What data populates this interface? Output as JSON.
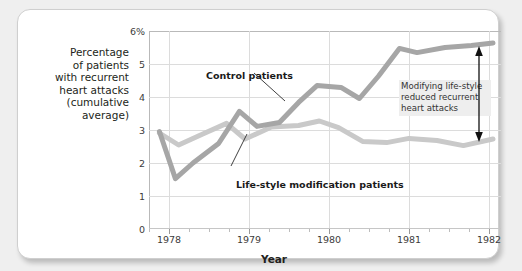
{
  "chart_data": {
    "type": "line",
    "title": "",
    "xlabel": "Year",
    "ylabel": "Percentage\nof patients\nwith recurrent\nheart attacks\n(cumulative\naverage)",
    "xlim": [
      1977.75,
      1982.15
    ],
    "ylim": [
      0,
      6.6
    ],
    "grid": true,
    "legend_position": "inline-annotations",
    "x_ticks": [
      "1978",
      "1979",
      "1980",
      "1981",
      "1982"
    ],
    "x_tick_values": [
      1978,
      1979,
      1980,
      1981,
      1982
    ],
    "x_minor_ticks_per_interval": 4,
    "y_ticks": [
      "0",
      "1",
      "2",
      "3",
      "4",
      "5",
      "6%"
    ],
    "y_tick_values": [
      0,
      1,
      2,
      3,
      4,
      5,
      6
    ],
    "series": [
      {
        "name": "Control patients",
        "color": "#a6a6a6",
        "x": [
          1977.88,
          1978.08,
          1978.3,
          1978.62,
          1978.88,
          1979.1,
          1979.38,
          1979.62,
          1979.85,
          1980.15,
          1980.38,
          1980.62,
          1980.88,
          1981.1,
          1981.45,
          1981.78,
          1982.05
        ],
        "values": [
          3.25,
          1.68,
          2.2,
          2.85,
          3.92,
          3.42,
          3.55,
          4.22,
          4.78,
          4.72,
          4.35,
          5.1,
          6.02,
          5.88,
          6.05,
          6.12,
          6.2
        ]
      },
      {
        "name": "Life-style modification patients",
        "color": "#c9c9c9",
        "x": [
          1977.88,
          1978.12,
          1978.45,
          1978.72,
          1978.95,
          1979.28,
          1979.62,
          1979.88,
          1980.12,
          1980.42,
          1980.72,
          1981.0,
          1981.35,
          1981.68,
          1982.05
        ],
        "values": [
          3.2,
          2.8,
          3.2,
          3.52,
          3.0,
          3.4,
          3.45,
          3.6,
          3.38,
          2.92,
          2.88,
          3.02,
          2.95,
          2.78,
          3.0
        ]
      }
    ],
    "annotations": [
      {
        "name": "control-patients-label",
        "text": "Control patients",
        "style": "bold-leader-line"
      },
      {
        "name": "life-style-modification-label",
        "text": "Life-style modification patients",
        "style": "bold-leader-line"
      },
      {
        "name": "difference-callout",
        "text": "Modifying life-style\nreduced recurrent\nheart attacks",
        "style": "boxed-gray"
      },
      {
        "name": "difference-arrow",
        "text": "",
        "style": "double-headed-vertical-arrow"
      }
    ]
  },
  "colors": {
    "control_line": "#a6a6a6",
    "lifestyle_line": "#c9c9c9",
    "gridline": "#dcdcdc",
    "axis": "#b9b9b9",
    "text": "#231f20",
    "callout_bg": "#eeeeee",
    "card_bg": "#ffffff",
    "page_bg": "#efefef"
  }
}
